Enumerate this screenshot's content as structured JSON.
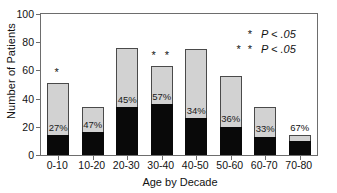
{
  "chart_data": {
    "type": "bar",
    "title": "",
    "xlabel": "Age by Decade",
    "ylabel": "Number of Patients",
    "ylim": [
      0,
      100
    ],
    "yticks": [
      0,
      20,
      40,
      60,
      80,
      100
    ],
    "grid": false,
    "legend_position": "top-right",
    "categories": [
      "0-10",
      "10-20",
      "20-30",
      "30-40",
      "40-50",
      "50-60",
      "60-70",
      "70-80"
    ],
    "series": [
      {
        "name": "Total patients",
        "values": [
          51,
          34,
          76,
          63,
          75,
          56,
          34,
          14
        ]
      },
      {
        "name": "Subset (filled black)",
        "values": [
          14,
          16,
          34,
          36,
          26,
          20,
          13,
          10
        ]
      }
    ],
    "data_labels": [
      "27%",
      "47%",
      "45%",
      "57%",
      "34%",
      "36%",
      "33%",
      "67%"
    ],
    "data_label_placement": [
      "inside",
      "inside",
      "inside",
      "inside",
      "inside",
      "inside",
      "inside",
      "above"
    ],
    "annotations": [
      {
        "category": "0-10",
        "symbol": "*"
      },
      {
        "category": "30-40",
        "symbol": "* *"
      }
    ],
    "legend": [
      {
        "symbol": "*",
        "text": "P < .05"
      },
      {
        "symbol": "* *",
        "text": "P < .05"
      }
    ],
    "colors": {
      "bar_fill": "#d2d2d2",
      "bar_edge": "#4a4a4a",
      "subset_fill": "#090909",
      "axis": "#6d6d6d",
      "text": "#121212"
    }
  }
}
